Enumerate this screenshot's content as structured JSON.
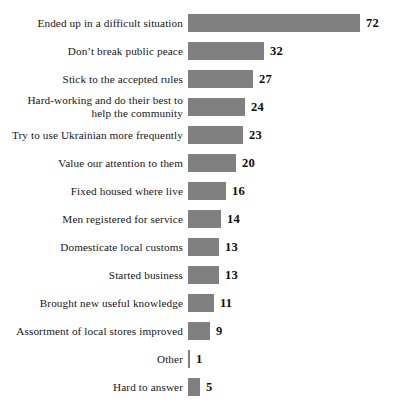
{
  "chart_data": {
    "type": "bar",
    "orientation": "horizontal",
    "title": "",
    "xlabel": "",
    "ylabel": "",
    "xlim": [
      0,
      72
    ],
    "grid": false,
    "legend": null,
    "bar_color": "#808080",
    "categories": [
      "Ended up in a difficult situation",
      "Don’t break public peace",
      "Stick to the accepted rules",
      "Hard-working and do their best to\nhelp the community",
      "Try to use Ukrainian more frequently",
      "Value our attention to them",
      "Fixed housed where live",
      "Men registered for service",
      "Domesticate local customs",
      "Started business",
      "Brought new useful knowledge",
      "Assortment of local stores improved",
      "Other",
      "Hard to answer"
    ],
    "values": [
      72,
      32,
      27,
      24,
      23,
      20,
      16,
      14,
      13,
      13,
      11,
      9,
      1,
      5
    ],
    "value_labels": [
      "72",
      "32",
      "27",
      "24",
      "23",
      "20",
      "16",
      "14",
      "13",
      "13",
      "11",
      "9",
      "1",
      "5"
    ]
  }
}
